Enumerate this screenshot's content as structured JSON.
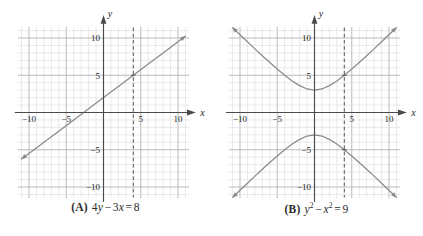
{
  "figure": {
    "kind": "two-panel-coordinate-graphs",
    "background": "#ffffff",
    "panels": [
      {
        "id": "panel-a",
        "caption_label": "(A)",
        "caption_equation_plain": "4y − 3x = 8",
        "caption_parts": {
          "a": "4",
          "y": "y",
          "minus": "−",
          "b": "3",
          "x": "x",
          "eq": "=",
          "rhs": "8"
        },
        "axis_x_name": "x",
        "axis_y_name": "y",
        "x_ticks": [
          -10,
          -5,
          5,
          10
        ],
        "y_ticks": [
          -10,
          -5,
          5,
          10
        ],
        "x_tick_labels": [
          "−10",
          "−5",
          "5",
          "10"
        ],
        "y_tick_labels": [
          "−10",
          "−5",
          "5",
          "10"
        ],
        "dashed_line_x": 4,
        "dashed_marker_points": [
          {
            "x": 4,
            "y": 5
          }
        ]
      },
      {
        "id": "panel-b",
        "caption_label": "(B)",
        "caption_equation_plain": "y² − x² = 9",
        "caption_parts": {
          "y": "y",
          "ysup": "2",
          "minus": "−",
          "x": "x",
          "xsup": "2",
          "eq": "=",
          "rhs": "9"
        },
        "axis_x_name": "x",
        "axis_y_name": "y",
        "x_ticks": [
          -10,
          -5,
          5,
          10
        ],
        "y_ticks": [
          -10,
          -5,
          5,
          10
        ],
        "x_tick_labels": [
          "−10",
          "−5",
          "5",
          "10"
        ],
        "y_tick_labels": [
          "−10",
          "−5",
          "5",
          "10"
        ],
        "dashed_line_x": 4,
        "dashed_marker_points": [
          {
            "x": 4,
            "y": 5
          },
          {
            "x": 4,
            "y": -5
          }
        ]
      }
    ]
  },
  "colors": {
    "curve": "#8a8a8a",
    "axis": "#4a4a4a",
    "grid_minor": "#d8d8d8",
    "grid_major": "#b3b3b3",
    "dashed": "#55555a",
    "text": "#1f1f1f",
    "background": "#ffffff"
  },
  "chart_data": [
    {
      "type": "line",
      "title": "(A) 4y − 3x = 8",
      "equation": "4y - 3x = 8",
      "slope": 0.75,
      "y_intercept": 2,
      "x_intercept": -2.6667,
      "xlabel": "x",
      "ylabel": "y",
      "xlim": [
        -11,
        11
      ],
      "ylim": [
        -11,
        11
      ],
      "grid": true,
      "grid_minor_step": 1,
      "grid_major_step": 5,
      "xticks": [
        -10,
        -5,
        5,
        10
      ],
      "yticks": [
        -10,
        -5,
        5,
        10
      ],
      "series": [
        {
          "name": "4y - 3x = 8",
          "x": [
            -11,
            -10,
            -8,
            -6,
            -4,
            -2.6667,
            -2,
            0,
            2,
            4,
            6,
            8,
            10,
            11
          ],
          "y": [
            -6.25,
            -5.5,
            -4,
            -2.5,
            -1,
            0,
            0.5,
            2,
            3.5,
            5,
            6.5,
            8,
            9.5,
            10.25
          ]
        }
      ],
      "annotations": [
        {
          "kind": "dashed-vertical",
          "x": 4,
          "label": ""
        },
        {
          "kind": "point",
          "x": 4,
          "y": 5
        }
      ],
      "legend": "none"
    },
    {
      "type": "line",
      "title": "(B) y² − x² = 9",
      "equation": "y^2 - x^2 = 9",
      "conic": "hyperbola",
      "vertices": [
        {
          "x": 0,
          "y": 3
        },
        {
          "x": 0,
          "y": -3
        }
      ],
      "asymptotes": [
        "y = x",
        "y = -x"
      ],
      "xlabel": "x",
      "ylabel": "y",
      "xlim": [
        -11,
        11
      ],
      "ylim": [
        -11,
        11
      ],
      "grid": true,
      "grid_minor_step": 1,
      "grid_major_step": 5,
      "xticks": [
        -10,
        -5,
        5,
        10
      ],
      "yticks": [
        -10,
        -5,
        5,
        10
      ],
      "series": [
        {
          "name": "upper branch y = +sqrt(x^2+9)",
          "x": [
            -11,
            -10,
            -9,
            -8,
            -7,
            -6,
            -5,
            -4,
            -3,
            -2,
            -1,
            0,
            1,
            2,
            3,
            4,
            5,
            6,
            7,
            8,
            9,
            10,
            11
          ],
          "y": [
            11.4,
            10.44,
            9.49,
            8.54,
            7.62,
            6.71,
            5.83,
            5.0,
            4.24,
            3.61,
            3.16,
            3.0,
            3.16,
            3.61,
            4.24,
            5.0,
            5.83,
            6.71,
            7.62,
            8.54,
            9.49,
            10.44,
            11.4
          ]
        },
        {
          "name": "lower branch y = -sqrt(x^2+9)",
          "x": [
            -11,
            -10,
            -9,
            -8,
            -7,
            -6,
            -5,
            -4,
            -3,
            -2,
            -1,
            0,
            1,
            2,
            3,
            4,
            5,
            6,
            7,
            8,
            9,
            10,
            11
          ],
          "y": [
            -11.4,
            -10.44,
            -9.49,
            -8.54,
            -7.62,
            -6.71,
            -5.83,
            -5.0,
            -4.24,
            -3.61,
            -3.16,
            -3.0,
            -3.16,
            -3.61,
            -4.24,
            -5.0,
            -5.83,
            -6.71,
            -7.62,
            -8.54,
            -9.49,
            -10.44,
            -11.4
          ]
        }
      ],
      "annotations": [
        {
          "kind": "dashed-vertical",
          "x": 4,
          "label": ""
        },
        {
          "kind": "point",
          "x": 4,
          "y": 5
        },
        {
          "kind": "point",
          "x": 4,
          "y": -5
        }
      ],
      "legend": "none"
    }
  ]
}
